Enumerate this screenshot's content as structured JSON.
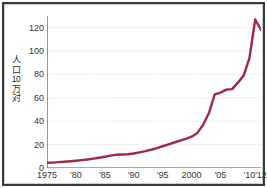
{
  "chart_data": {
    "type": "line",
    "title": "",
    "subtitle": "",
    "xlabel": "",
    "ylabel": "人口10万対",
    "ylabel_parts": [
      "人",
      "口",
      "10",
      "万",
      "対"
    ],
    "xlim": [
      1975,
      2012
    ],
    "ylim": [
      0,
      130
    ],
    "yticks": [
      0,
      20,
      40,
      60,
      80,
      100,
      120
    ],
    "ytick_labels": [
      "0",
      "20",
      "40",
      "60",
      "80",
      "100",
      "120"
    ],
    "xticks": [
      1975,
      1980,
      1985,
      1990,
      1995,
      2000,
      2005,
      2010,
      2012
    ],
    "xtick_labels": [
      "1975",
      "'80",
      "'85",
      "'90",
      "'95",
      "2000",
      "'05",
      "'10",
      "'12"
    ],
    "grid": "horizontal-dotted",
    "legend": "none",
    "line_color": "#9e2a46",
    "line_width": 2.4,
    "series": [
      {
        "name": "人口10万対",
        "x": [
          1975,
          1976,
          1977,
          1978,
          1979,
          1980,
          1981,
          1982,
          1983,
          1984,
          1985,
          1986,
          1987,
          1988,
          1989,
          1990,
          1991,
          1992,
          1993,
          1994,
          1995,
          1996,
          1997,
          1998,
          1999,
          2000,
          2001,
          2002,
          2003,
          2004,
          2005,
          2006,
          2007,
          2008,
          2009,
          2010,
          2011,
          2012
        ],
        "values": [
          4.5,
          4.6,
          5.0,
          5.4,
          5.8,
          6.2,
          6.7,
          7.3,
          8.0,
          8.8,
          9.6,
          10.6,
          11.3,
          11.5,
          11.8,
          12.4,
          13.4,
          14.4,
          15.6,
          17.0,
          18.6,
          20.2,
          21.8,
          23.4,
          25.0,
          26.8,
          30.0,
          37.0,
          47.0,
          63.0,
          64.5,
          67.0,
          67.5,
          73.0,
          79.0,
          94.0,
          127.0,
          118.0
        ]
      }
    ]
  },
  "axis": {
    "y_title_line1": "人",
    "y_title_line2": "口",
    "y_title_line3": "10",
    "y_title_line4": "万",
    "y_title_line5": "対"
  },
  "colors": {
    "line": "#9e2a46",
    "frame": "#3a3a3a",
    "grid": "#c8c8c8",
    "axis": "#555555",
    "background": "#ffffff",
    "text": "#333333"
  }
}
